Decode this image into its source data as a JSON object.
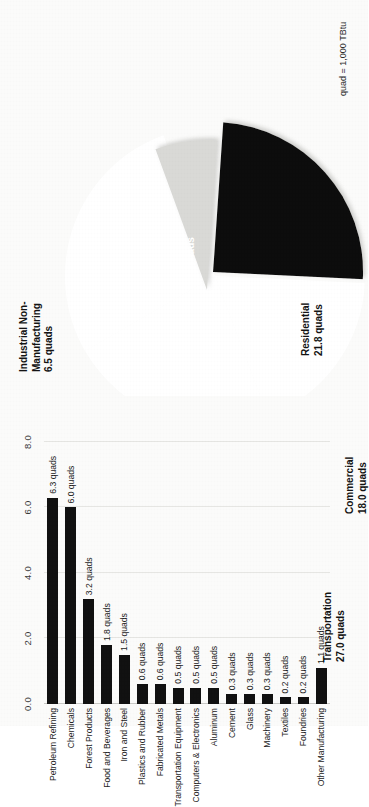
{
  "figure": {
    "footnote": "quad = 1,000 TBtu"
  },
  "chart_data": [
    {
      "type": "pie",
      "title": "",
      "unit": "quads",
      "legend_position": "outside-labels",
      "categories": [
        "Transportation",
        "Industrial Non-Manufacturing",
        "Industrial Manufacturing",
        "Commercial",
        "Residential"
      ],
      "values": [
        27.0,
        6.5,
        24.0,
        18.0,
        21.8
      ],
      "labels": [
        "Transportation\n27.0 quads",
        "Industrial Non-\nManufacturing\n6.5 quads",
        "Industrial\nManufacturing\n24.0 quads",
        "Commercial\n18.0 quads",
        "Residential\n21.8 quads"
      ],
      "slice_fills": [
        "#ffffff",
        "#d9d9d6",
        "#111111",
        "#ffffff",
        "#ffffff"
      ],
      "exploded": [
        "Industrial Non-Manufacturing",
        "Industrial Manufacturing"
      ]
    },
    {
      "type": "bar",
      "orientation": "horizontal",
      "title": "",
      "xlabel": "",
      "ylabel": "",
      "unit": "quads",
      "xlim": [
        0.0,
        8.0
      ],
      "grid": true,
      "bar_color": "#111111",
      "ticks": [
        "0.0",
        "2.0",
        "4.0",
        "6.0",
        "8.0"
      ],
      "tick_values": [
        0.0,
        2.0,
        4.0,
        6.0,
        8.0
      ],
      "categories": [
        "Petroleum Refining",
        "Chemicals",
        "Forest Products",
        "Food and Beverages",
        "Iron and Steel",
        "Plastics and Rubber",
        "Fabricated Metals",
        "Transportation Equipment",
        "Computers & Electronics",
        "Aluminum",
        "Cement",
        "Glass",
        "Machinery",
        "Textiles",
        "Foundries",
        "Other Manufacturing"
      ],
      "values": [
        6.3,
        6.0,
        3.2,
        1.8,
        1.5,
        0.6,
        0.6,
        0.5,
        0.5,
        0.5,
        0.3,
        0.3,
        0.3,
        0.2,
        0.2,
        1.1
      ],
      "value_labels": [
        "6.3 quads",
        "6.0 quads",
        "3.2 quads",
        "1.8 quads",
        "1.5 quads",
        "0.6 quads",
        "0.6 quads",
        "0.5 quads",
        "0.5 quads",
        "0.5 quads",
        "0.3 quads",
        "0.3 quads",
        "0.3 quads",
        "0.2 quads",
        "0.2 quads",
        "1.1 quads"
      ]
    }
  ]
}
